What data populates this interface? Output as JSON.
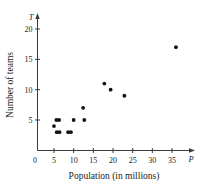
{
  "chart_data": {
    "type": "scatter",
    "title": "",
    "xlabel": "Population (in millions)",
    "ylabel": "Number of teams",
    "x_var": "P",
    "y_var": "T",
    "xlim": [
      0,
      38
    ],
    "ylim": [
      0,
      21
    ],
    "grid": false,
    "legend": null,
    "origin_label": "0",
    "xticks": [
      5,
      10,
      15,
      20,
      25,
      30,
      35
    ],
    "xtick_labels": [
      "5",
      "10",
      "15",
      "20",
      "25",
      "30",
      "35"
    ],
    "yticks": [
      5,
      10,
      15,
      20
    ],
    "ytick_labels": [
      "5",
      "10",
      "15",
      "20"
    ],
    "marker": "filled-circle",
    "marker_color": "#111111",
    "points": [
      {
        "x": 5.0,
        "y": 4
      },
      {
        "x": 5.6,
        "y": 5
      },
      {
        "x": 6.3,
        "y": 5
      },
      {
        "x": 5.7,
        "y": 3
      },
      {
        "x": 6.4,
        "y": 3
      },
      {
        "x": 8.6,
        "y": 3
      },
      {
        "x": 9.3,
        "y": 3
      },
      {
        "x": 10.0,
        "y": 5
      },
      {
        "x": 12.4,
        "y": 7
      },
      {
        "x": 12.7,
        "y": 5
      },
      {
        "x": 17.8,
        "y": 11
      },
      {
        "x": 19.4,
        "y": 10
      },
      {
        "x": 22.9,
        "y": 9
      },
      {
        "x": 36.0,
        "y": 17
      }
    ]
  }
}
